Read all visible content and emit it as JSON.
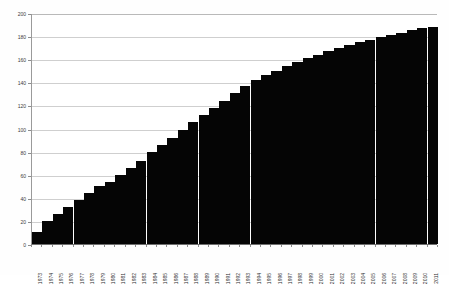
{
  "chart_data": {
    "type": "bar",
    "title": "",
    "subtitle": "",
    "xlabel": "",
    "ylabel": "",
    "ylim": [
      0,
      200
    ],
    "ytick_step": 20,
    "yticks": [
      0,
      20,
      40,
      60,
      80,
      100,
      120,
      140,
      160,
      180,
      200
    ],
    "ytick_labels": [
      "0",
      "20",
      "40",
      "60",
      "80",
      "100",
      "120",
      "140",
      "160",
      "180",
      "200"
    ],
    "grid": true,
    "grid_axis": "y",
    "legend": false,
    "legend_position": "none",
    "bar_color": "#050505",
    "grid_color": "#cfcfcf",
    "axis_color": "#8c8c8c",
    "background_color": "#ffffff",
    "xtick_rotation": -90,
    "categories": [
      "1973",
      "1974",
      "1975",
      "1976",
      "1977",
      "1978",
      "1979",
      "1980",
      "1981",
      "1982",
      "1983",
      "1984",
      "1985",
      "1986",
      "1987",
      "1988",
      "1989",
      "1990",
      "1991",
      "1992",
      "1993",
      "1994",
      "1995",
      "1996",
      "1997",
      "1998",
      "1999",
      "2000",
      "2001",
      "2002",
      "2003",
      "2004",
      "2005",
      "2006",
      "2007",
      "2008",
      "2009",
      "2010",
      "2011"
    ],
    "values": [
      10,
      20,
      26,
      32,
      38,
      44,
      50,
      54,
      60,
      66,
      72,
      80,
      86,
      92,
      99,
      106,
      112,
      118,
      124,
      131,
      137,
      142,
      146,
      150,
      154,
      158,
      161,
      164,
      167,
      170,
      172,
      175,
      177,
      179,
      181,
      183,
      185,
      187,
      188
    ],
    "series_name": "Cumulative total"
  }
}
